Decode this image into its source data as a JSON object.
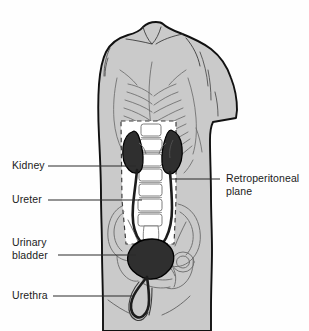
{
  "figure": {
    "type": "anatomical-diagram",
    "view": "anterior torso",
    "colors": {
      "background": "#fefefe",
      "body_fill": "#cacaca",
      "body_outline": "#111111",
      "bone_outline": "#7a7a7a",
      "organ_fill": "#2f2f2f",
      "organ_outline": "#000000",
      "retroperitoneal_fill": "#ffffff",
      "dashed_line": "#3a3a3a",
      "leader_line": "#2a2a2a",
      "text": "#1b1b1b"
    }
  },
  "labels": [
    {
      "id": "kidney",
      "text": "Kidney",
      "side": "left",
      "x": 12,
      "y": 160,
      "leader": {
        "x1": 48,
        "y1": 166,
        "x2": 136,
        "y2": 166
      }
    },
    {
      "id": "ureter",
      "text": "Ureter",
      "side": "left",
      "x": 12,
      "y": 194,
      "leader": {
        "x1": 48,
        "y1": 200,
        "x2": 142,
        "y2": 200
      }
    },
    {
      "id": "urinary-bladder",
      "text": "Urinary\nbladder",
      "side": "left",
      "x": 12,
      "y": 236,
      "leader": {
        "x1": 58,
        "y1": 255,
        "x2": 136,
        "y2": 255
      }
    },
    {
      "id": "urethra",
      "text": "Urethra",
      "side": "left",
      "x": 12,
      "y": 290,
      "leader": {
        "x1": 53,
        "y1": 296,
        "x2": 133,
        "y2": 296
      }
    },
    {
      "id": "retroperitoneal-plane",
      "text": "Retroperitoneal\nplane",
      "side": "right",
      "x": 226,
      "y": 173,
      "leader": {
        "x1": 220,
        "y1": 179,
        "x2": 170,
        "y2": 179
      }
    }
  ],
  "structures": [
    {
      "id": "torso",
      "name": "Torso silhouette"
    },
    {
      "id": "ribcage",
      "name": "Rib cage"
    },
    {
      "id": "pelvis",
      "name": "Pelvic bones"
    },
    {
      "id": "spine",
      "name": "Lumbar vertebral column"
    },
    {
      "id": "kidney-left",
      "name": "Left kidney"
    },
    {
      "id": "kidney-right",
      "name": "Right kidney"
    },
    {
      "id": "ureter-left",
      "name": "Left ureter"
    },
    {
      "id": "ureter-right",
      "name": "Right ureter"
    },
    {
      "id": "bladder",
      "name": "Urinary bladder"
    },
    {
      "id": "urethra",
      "name": "Urethra"
    },
    {
      "id": "retroperitoneal-plane",
      "name": "Retroperitoneal plane (dashed outline)"
    }
  ]
}
